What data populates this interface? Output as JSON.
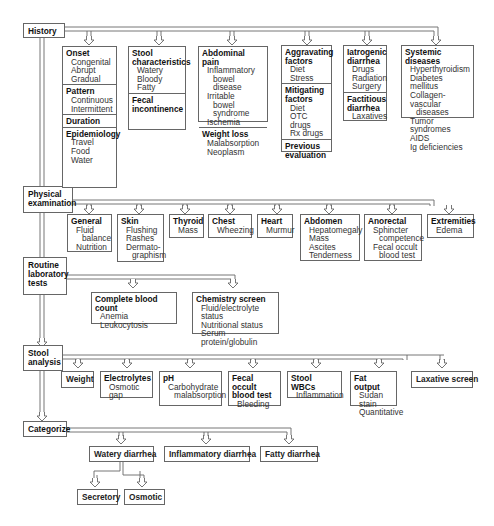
{
  "diagram": {
    "stages": [
      {
        "id": "history",
        "label": "History"
      },
      {
        "id": "physical",
        "label": "Physical examination",
        "lines": [
          "Physical",
          "examination"
        ]
      },
      {
        "id": "routine",
        "label": "Routine laboratory tests",
        "lines": [
          "Routine",
          "laboratory",
          "tests"
        ]
      },
      {
        "id": "stool",
        "label": "Stool analysis",
        "lines": [
          "Stool",
          "analysis"
        ]
      },
      {
        "id": "categorize",
        "label": "Categorize"
      }
    ],
    "history": {
      "box1": {
        "onset": {
          "title": "Onset",
          "items": [
            "Congenital",
            "Abrupt",
            "Gradual"
          ]
        },
        "pattern": {
          "title": "Pattern",
          "items": [
            "Continuous",
            "Intermittent"
          ]
        },
        "duration": {
          "title": "Duration"
        },
        "epidemiology": {
          "title": "Epidemiology",
          "items": [
            "Travel",
            "Food",
            "Water"
          ]
        }
      },
      "box2": {
        "stool_char": {
          "title_l1": "Stool",
          "title_l2": "characteristics",
          "items": [
            "Watery",
            "Bloody",
            "Fatty"
          ]
        },
        "fecal_incont": {
          "title_l1": "Fecal",
          "title_l2": "incontinence"
        }
      },
      "box3": {
        "abdominal_pain": {
          "title": "Abdominal pain",
          "items": [
            "Inflammatory",
            "bowel disease",
            "Irritable",
            "bowel syndrome",
            "Ischemia"
          ]
        },
        "weight_loss": {
          "title": "Weight loss",
          "items": [
            "Malabsorption",
            "Neoplasm"
          ]
        }
      },
      "box4": {
        "aggravating": {
          "title_l1": "Aggravating",
          "title_l2": "factors",
          "items": [
            "Diet",
            "Stress"
          ]
        },
        "mitigating": {
          "title_l1": "Mitigating",
          "title_l2": "factors",
          "items": [
            "Diet",
            "OTC drugs",
            "Rx drugs"
          ]
        },
        "previous": {
          "title_l1": "Previous",
          "title_l2": "evaluation"
        }
      },
      "box5": {
        "iatrogenic": {
          "title_l1": "Iatrogenic",
          "title_l2": "diarrhea",
          "items": [
            "Drugs",
            "Radiation",
            "Surgery"
          ]
        },
        "factitious": {
          "title_l1": "Factitious",
          "title_l2": "diarrhea",
          "items": [
            "Laxatives"
          ]
        }
      },
      "box6": {
        "systemic": {
          "title": "Systemic diseases",
          "items": [
            "Hyperthyroidism",
            "Diabetes mellitus",
            "Collagen-vascular",
            "diseases",
            "Tumor syndromes",
            "AIDS",
            "Ig deficiencies"
          ]
        }
      }
    },
    "physical": {
      "general": {
        "title": "General",
        "items": [
          "Fluid",
          "balance",
          "Nutrition"
        ]
      },
      "skin": {
        "title": "Skin",
        "items": [
          "Flushing",
          "Rashes",
          "Dermato-",
          "graphism"
        ]
      },
      "thyroid": {
        "title": "Thyroid",
        "items": [
          "Mass"
        ]
      },
      "chest": {
        "title": "Chest",
        "items": [
          "Wheezing"
        ]
      },
      "heart": {
        "title": "Heart",
        "items": [
          "Murmur"
        ]
      },
      "abdomen": {
        "title": "Abdomen",
        "items": [
          "Hepatomegaly",
          "Mass",
          "Ascites",
          "Tenderness"
        ]
      },
      "anorectal": {
        "title": "Anorectal",
        "items": [
          "Sphincter",
          "competence",
          "Fecal occult",
          "blood test"
        ]
      },
      "extremities": {
        "title": "Extremities",
        "items": [
          "Edema"
        ]
      }
    },
    "routine": {
      "cbc": {
        "title": "Complete blood count",
        "items": [
          "Anemia",
          "Leukocytosis"
        ]
      },
      "chem": {
        "title": "Chemistry screen",
        "items": [
          "Fluid/electrolyte status",
          "Nutritional status",
          "Serum protein/globulin"
        ]
      }
    },
    "stool": {
      "weight": {
        "title": "Weight"
      },
      "electrolytes": {
        "title": "Electrolytes",
        "items": [
          "Osmotic gap"
        ]
      },
      "ph": {
        "title": "pH",
        "items": [
          "Carbohydrate",
          "malabsorption"
        ]
      },
      "fobt": {
        "title_l1": "Fecal occult",
        "title_l2": "blood test",
        "items": [
          "Bleeding"
        ]
      },
      "wbc": {
        "title": "Stool WBCs",
        "items": [
          "Inflammation"
        ]
      },
      "fat": {
        "title": "Fat output",
        "items": [
          "Sudan stain",
          "Quantitative"
        ]
      },
      "laxative": {
        "title": "Laxative screen"
      }
    },
    "categorize": {
      "watery": "Watery diarrhea",
      "inflammatory": "Inflammatory diarrhea",
      "fatty": "Fatty diarrhea",
      "secretory": "Secretory",
      "osmotic": "Osmotic"
    }
  }
}
